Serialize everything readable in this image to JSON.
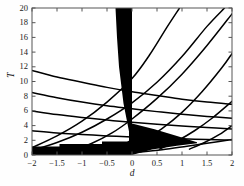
{
  "chart_data": {
    "type": "line",
    "title": "",
    "xlabel": "d",
    "ylabel": "T",
    "xlim": [
      -2,
      2
    ],
    "ylim": [
      0,
      20
    ],
    "grid": false,
    "legend": null,
    "xticks": [
      -2,
      -1.5,
      -1,
      -0.5,
      0,
      0.5,
      1,
      1.5,
      2
    ],
    "xticklabels": [
      "−2",
      "−1.5",
      "−1",
      "−0.5",
      "0",
      "0.5",
      "1",
      "1.5",
      "2"
    ],
    "yticks": [
      0,
      2,
      4,
      6,
      8,
      10,
      12,
      14,
      16,
      18,
      20
    ],
    "yticklabels": [
      "0",
      "2",
      "4",
      "6",
      "8",
      "10",
      "12",
      "14",
      "16",
      "18",
      "20"
    ],
    "curve_color": "#000000",
    "fill_color": "#000000",
    "background_color": "#ffffff",
    "series": [
      {
        "name": "descending-branch-1",
        "comment": "falls from left edge toward right edge",
        "points": [
          [
            -2,
            11.5
          ],
          [
            -1.5,
            10.6
          ],
          [
            -1.0,
            9.9
          ],
          [
            -0.5,
            9.2
          ],
          [
            0.0,
            8.6
          ],
          [
            0.5,
            8.1
          ],
          [
            1.0,
            7.6
          ],
          [
            1.5,
            7.2
          ],
          [
            2.0,
            6.9
          ]
        ]
      },
      {
        "name": "descending-branch-2",
        "points": [
          [
            -2,
            8.5
          ],
          [
            -1.5,
            7.8
          ],
          [
            -1.0,
            7.2
          ],
          [
            -0.5,
            6.7
          ],
          [
            0.0,
            6.3
          ],
          [
            0.5,
            5.9
          ],
          [
            1.0,
            5.55
          ],
          [
            1.5,
            5.25
          ],
          [
            2.0,
            5.0
          ]
        ]
      },
      {
        "name": "descending-branch-3",
        "points": [
          [
            -2,
            6.0
          ],
          [
            -1.5,
            5.5
          ],
          [
            -1.0,
            5.1
          ],
          [
            -0.5,
            4.75
          ],
          [
            0.0,
            4.45
          ],
          [
            0.5,
            4.2
          ],
          [
            1.0,
            3.95
          ],
          [
            1.5,
            3.75
          ],
          [
            2.0,
            3.55
          ]
        ]
      },
      {
        "name": "descending-branch-4",
        "points": [
          [
            -2,
            3.3
          ],
          [
            -1.5,
            3.0
          ],
          [
            -1.0,
            2.8
          ],
          [
            -0.5,
            2.6
          ],
          [
            0.0,
            2.45
          ],
          [
            0.5,
            2.3
          ],
          [
            1.0,
            2.2
          ],
          [
            1.5,
            2.1
          ],
          [
            2.0,
            2.0
          ]
        ]
      },
      {
        "name": "ascending-branch-1",
        "comment": "rises left-to-right, exits top edge",
        "points": [
          [
            -2,
            1.0
          ],
          [
            -1.5,
            2.6
          ],
          [
            -1.0,
            4.6
          ],
          [
            -0.5,
            7.2
          ],
          [
            0.0,
            10.4
          ],
          [
            0.35,
            13.6
          ],
          [
            0.7,
            17.4
          ],
          [
            0.95,
            20.0
          ]
        ]
      },
      {
        "name": "ascending-branch-2",
        "points": [
          [
            -2,
            0.6
          ],
          [
            -1.5,
            1.7
          ],
          [
            -1.0,
            3.1
          ],
          [
            -0.5,
            4.9
          ],
          [
            0.0,
            7.1
          ],
          [
            0.5,
            9.9
          ],
          [
            1.0,
            13.4
          ],
          [
            1.5,
            17.5
          ],
          [
            1.85,
            20.0
          ]
        ]
      },
      {
        "name": "ascending-branch-3",
        "points": [
          [
            -1.2,
            0.6
          ],
          [
            -0.8,
            1.6
          ],
          [
            -0.4,
            3.0
          ],
          [
            0.0,
            4.9
          ],
          [
            0.5,
            7.7
          ],
          [
            1.0,
            11.0
          ],
          [
            1.5,
            14.9
          ],
          [
            2.0,
            19.2
          ]
        ]
      },
      {
        "name": "ascending-branch-4",
        "points": [
          [
            -0.15,
            0.7
          ],
          [
            0.2,
            1.9
          ],
          [
            0.6,
            3.6
          ],
          [
            1.0,
            5.8
          ],
          [
            1.4,
            8.6
          ],
          [
            1.8,
            11.9
          ],
          [
            2.0,
            13.8
          ]
        ]
      },
      {
        "name": "ascending-branch-5",
        "points": [
          [
            0.55,
            0.8
          ],
          [
            0.9,
            1.9
          ],
          [
            1.25,
            3.3
          ],
          [
            1.6,
            5.0
          ],
          [
            2.0,
            7.3
          ]
        ]
      },
      {
        "name": "ascending-branch-6",
        "points": [
          [
            1.15,
            0.8
          ],
          [
            1.45,
            1.7
          ],
          [
            1.75,
            2.8
          ],
          [
            2.0,
            4.0
          ]
        ]
      },
      {
        "name": "lower-rising-right",
        "comment": "shallow curve under bottom wedge on the right",
        "points": [
          [
            0.0,
            0.3
          ],
          [
            0.6,
            0.7
          ],
          [
            1.1,
            1.2
          ],
          [
            1.5,
            1.6
          ],
          [
            2.0,
            2.1
          ]
        ]
      }
    ],
    "filled_regions": [
      {
        "name": "central-column",
        "comment": "near-vertical black band just left of d=0 widening toward T=20",
        "polygon": [
          [
            -0.33,
            20.0
          ],
          [
            0.0,
            20.0
          ],
          [
            0.0,
            0.0
          ],
          [
            -0.06,
            0.0
          ],
          [
            -0.06,
            3.2
          ],
          [
            -0.17,
            7.0
          ],
          [
            -0.26,
            12.0
          ],
          [
            -0.3,
            16.0
          ]
        ]
      },
      {
        "name": "bottom-band-left",
        "comment": "stepped black band along T=0 for d<0",
        "polygon": [
          [
            -2.0,
            1.15
          ],
          [
            -1.45,
            1.15
          ],
          [
            -1.45,
            1.5
          ],
          [
            -0.6,
            1.5
          ],
          [
            -0.6,
            1.85
          ],
          [
            -0.1,
            1.85
          ],
          [
            0.0,
            2.1
          ],
          [
            0.0,
            0.0
          ],
          [
            -2.0,
            0.0
          ]
        ]
      },
      {
        "name": "bottom-wedge-right",
        "comment": "black wedge right of d=0 tapering to a point near d=1.3",
        "polygon": [
          [
            0.0,
            4.3
          ],
          [
            0.45,
            3.5
          ],
          [
            0.9,
            2.6
          ],
          [
            1.3,
            1.75
          ],
          [
            1.3,
            1.6
          ],
          [
            0.9,
            1.25
          ],
          [
            0.4,
            0.75
          ],
          [
            0.0,
            0.0
          ]
        ]
      }
    ]
  },
  "axes": {
    "xlabel": "d",
    "ylabel": "T"
  }
}
